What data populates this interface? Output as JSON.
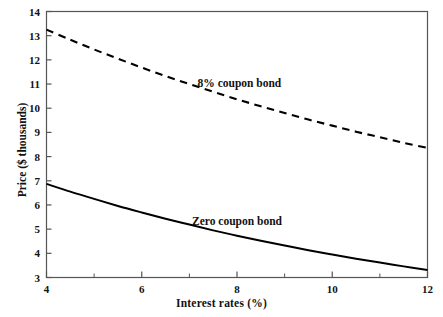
{
  "chart_data": {
    "type": "line",
    "title": "",
    "xlabel": "Interest rates (%)",
    "ylabel": "Price ($ thousands)",
    "xlim": [
      4,
      12
    ],
    "ylim": [
      3,
      14
    ],
    "grid": false,
    "legend_position": "inline-annotation",
    "x_major_ticks": [
      4,
      6,
      8,
      10,
      12
    ],
    "x_minor_ticks": [
      5,
      7,
      9,
      11
    ],
    "x_tick_labels": [
      "4",
      "6",
      "8",
      "10",
      "12"
    ],
    "y_major_ticks": [
      3,
      4,
      5,
      6,
      7,
      8,
      9,
      10,
      11,
      12,
      13,
      14
    ],
    "y_tick_labels": [
      "3",
      "4",
      "5",
      "6",
      "7",
      "8",
      "9",
      "10",
      "11",
      "12",
      "13",
      "14"
    ],
    "x": [
      4,
      4.5,
      5,
      5.5,
      6,
      6.5,
      7,
      7.5,
      8,
      8.5,
      9,
      9.5,
      10,
      10.5,
      11,
      11.5,
      12
    ],
    "series": [
      {
        "name": "8% coupon bond",
        "style": "dashed",
        "color": "#000000",
        "label_x": 8.05,
        "label_y": 11.05,
        "values": [
          13.25,
          12.83,
          12.43,
          12.05,
          11.68,
          11.33,
          11.0,
          10.68,
          10.37,
          10.08,
          9.8,
          9.53,
          9.28,
          9.03,
          8.8,
          8.57,
          8.36
        ]
      },
      {
        "name": "Zero coupon bond",
        "style": "solid",
        "color": "#000000",
        "label_x": 8.0,
        "label_y": 5.35,
        "values": [
          6.87,
          6.55,
          6.25,
          5.96,
          5.69,
          5.43,
          5.19,
          4.95,
          4.73,
          4.52,
          4.32,
          4.13,
          3.95,
          3.78,
          3.62,
          3.46,
          3.31
        ]
      }
    ],
    "axis_color": "#555555",
    "curve_color": "#000000",
    "background": "#ffffff"
  }
}
